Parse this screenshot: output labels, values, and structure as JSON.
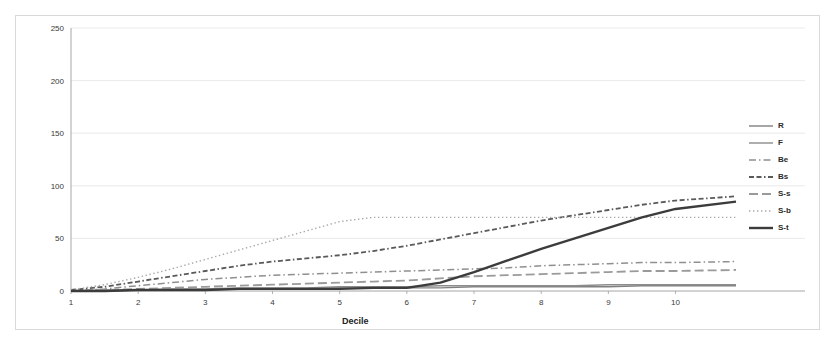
{
  "chart_data": {
    "type": "line",
    "title": "",
    "xlabel": "Decile",
    "ylabel": "Cumulative occurrence",
    "xlim": [
      1,
      10.9
    ],
    "ylim": [
      0,
      250
    ],
    "xticks": [
      1,
      2,
      3,
      4,
      5,
      6,
      7,
      8,
      9,
      10
    ],
    "xtick_labels": [
      "1",
      "2",
      "3",
      "4",
      "5",
      "6",
      "7",
      "8",
      "9",
      "10"
    ],
    "yticks": [
      0,
      50,
      100,
      150,
      200,
      250
    ],
    "ytick_labels": [
      "0",
      "50",
      "100",
      "150",
      "200",
      "250"
    ],
    "grid": "horizontal",
    "legend_position": "right",
    "x": [
      1,
      1.5,
      2,
      2.5,
      3,
      3.5,
      4,
      4.5,
      5,
      5.5,
      6,
      6.5,
      7,
      7.5,
      8,
      8.5,
      9,
      9.5,
      10,
      10.9
    ],
    "series": [
      {
        "name": "R",
        "label": "R",
        "style": "solid-thin",
        "color": "#808080",
        "values": [
          0,
          0,
          1,
          1,
          1,
          2,
          2,
          2,
          3,
          3,
          3,
          3,
          4,
          4,
          4,
          4,
          4,
          5,
          5,
          5
        ]
      },
      {
        "name": "F",
        "label": "F",
        "style": "solid-thin",
        "color": "#8c8c8c",
        "values": [
          0,
          1,
          1,
          2,
          2,
          3,
          3,
          3,
          4,
          4,
          4,
          5,
          5,
          5,
          5,
          5,
          6,
          6,
          6,
          6
        ]
      },
      {
        "name": "Be",
        "label": "Be",
        "style": "dash-dot",
        "color": "#8f8f8f",
        "values": [
          0,
          2,
          5,
          8,
          11,
          13,
          15,
          16,
          17,
          18,
          19,
          20,
          21,
          22,
          24,
          25,
          26,
          27,
          27,
          28
        ]
      },
      {
        "name": "Bs",
        "label": "Bs",
        "style": "dash-dash-dot",
        "color": "#5a5a5a",
        "values": [
          1,
          4,
          9,
          14,
          19,
          24,
          28,
          31,
          34,
          38,
          43,
          49,
          55,
          61,
          67,
          72,
          77,
          82,
          86,
          90
        ]
      },
      {
        "name": "S-s",
        "label": "S-s",
        "style": "long-dash",
        "color": "#9a9a9a",
        "values": [
          0,
          1,
          2,
          3,
          4,
          5,
          6,
          7,
          8,
          9,
          10,
          12,
          14,
          15,
          16,
          17,
          18,
          19,
          19,
          20
        ]
      },
      {
        "name": "S-b",
        "label": "S-b",
        "style": "dotted",
        "color": "#a8a8a8",
        "values": [
          1,
          6,
          13,
          21,
          30,
          39,
          48,
          57,
          66,
          70,
          70,
          70,
          70,
          70,
          70,
          70,
          70,
          70,
          70,
          70
        ]
      },
      {
        "name": "S-t",
        "label": "S-t",
        "style": "solid-thick",
        "color": "#3c3c3c",
        "values": [
          0,
          0,
          1,
          1,
          1,
          2,
          2,
          2,
          2,
          3,
          3,
          8,
          18,
          29,
          40,
          50,
          60,
          70,
          78,
          85
        ]
      }
    ]
  },
  "axes": {
    "y_title": "Cumulative occurrence",
    "x_title": "Decile"
  }
}
